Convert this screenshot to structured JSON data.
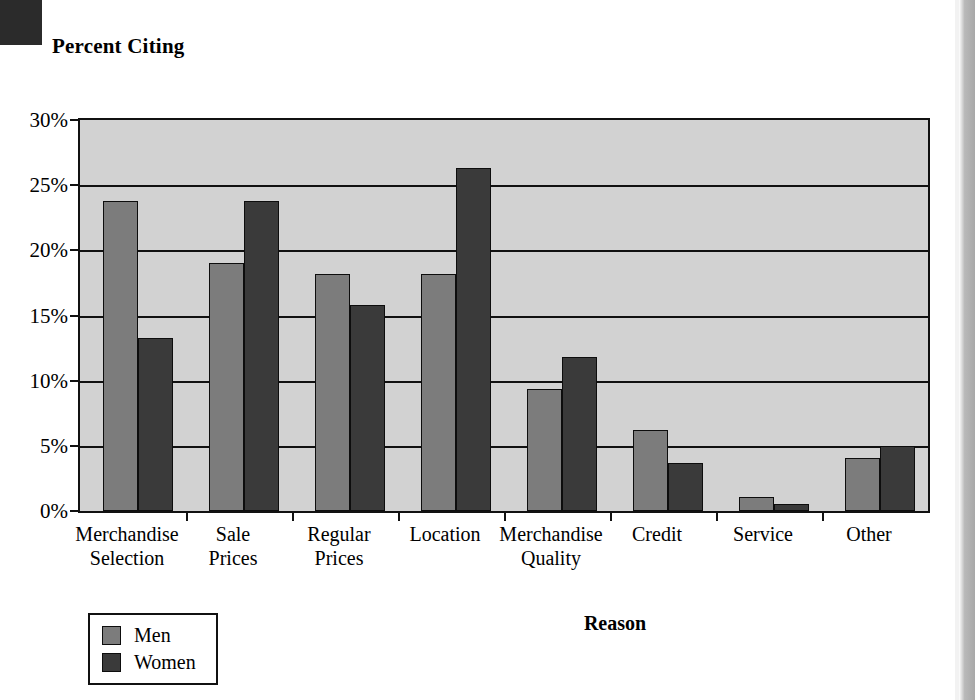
{
  "chart_data": {
    "type": "bar",
    "title": "",
    "ylabel": "Percent Citing",
    "xlabel": "Reason",
    "grid": true,
    "legend_position": "bottom-left",
    "ylim": [
      0,
      30
    ],
    "ytick_labels": [
      "0%",
      "5%",
      "10%",
      "15%",
      "20%",
      "25%",
      "30%"
    ],
    "ytick_values": [
      0,
      5,
      10,
      15,
      20,
      25,
      30
    ],
    "categories": [
      "Merchandise\nSelection",
      "Sale\nPrices",
      "Regular\nPrices",
      "Location",
      "Merchandise\nQuality",
      "Credit",
      "Service",
      "Other"
    ],
    "category_lines": [
      [
        "Merchandise",
        "Selection"
      ],
      [
        "Sale",
        "Prices"
      ],
      [
        "Regular",
        "Prices"
      ],
      [
        "Location",
        ""
      ],
      [
        "Merchandise",
        "Quality"
      ],
      [
        "Credit",
        ""
      ],
      [
        "Service",
        ""
      ],
      [
        "Other",
        ""
      ]
    ],
    "series": [
      {
        "name": "Men",
        "color": "#7c7c7c",
        "values": [
          23.8,
          19.0,
          18.2,
          18.2,
          9.4,
          6.2,
          1.1,
          4.1
        ]
      },
      {
        "name": "Women",
        "color": "#3a3a3a",
        "values": [
          13.3,
          23.8,
          15.8,
          26.3,
          11.8,
          3.7,
          0.5,
          5.0
        ]
      }
    ]
  },
  "legend": {
    "entries": [
      {
        "label": "Men",
        "color": "#7c7c7c"
      },
      {
        "label": "Women",
        "color": "#3a3a3a"
      }
    ]
  },
  "colors": {
    "plot_background": "#d2d2d2",
    "axis": "#111111",
    "men": "#7c7c7c",
    "women": "#3a3a3a",
    "page_background": "#ffffff"
  }
}
